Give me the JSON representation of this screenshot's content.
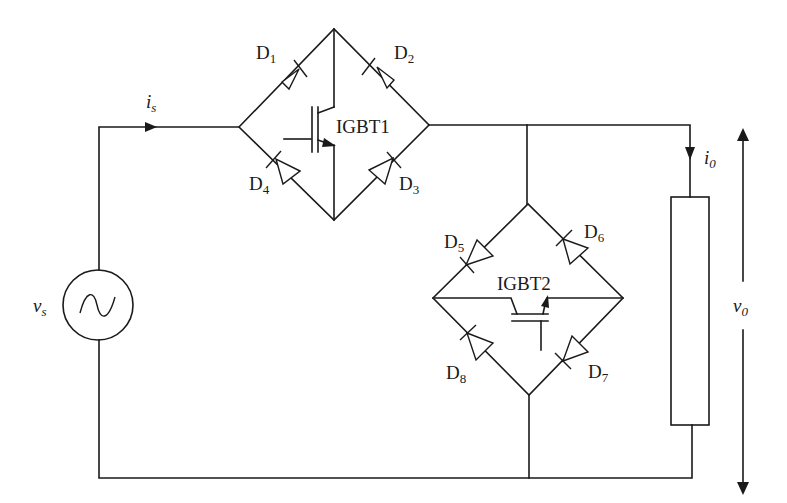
{
  "diagram": {
    "type": "circuit-schematic",
    "colors": {
      "line": "#1a1a1a",
      "background": "#ffffff"
    }
  },
  "source": {
    "label_main": "v",
    "label_sub": "s",
    "icon": "ac-sine-source-icon"
  },
  "source_current": {
    "label_main": "i",
    "label_sub": "s",
    "icon": "arrow-right-icon"
  },
  "bridge1": {
    "switch_label": "IGBT1",
    "diodes": [
      {
        "main": "D",
        "sub": "1"
      },
      {
        "main": "D",
        "sub": "2"
      },
      {
        "main": "D",
        "sub": "3"
      },
      {
        "main": "D",
        "sub": "4"
      }
    ]
  },
  "bridge2": {
    "switch_label": "IGBT2",
    "diodes": [
      {
        "main": "D",
        "sub": "5"
      },
      {
        "main": "D",
        "sub": "6"
      },
      {
        "main": "D",
        "sub": "7"
      },
      {
        "main": "D",
        "sub": "8"
      }
    ]
  },
  "load": {
    "current_main": "i",
    "current_sub": "0",
    "voltage_main": "v",
    "voltage_sub": "0",
    "icon": "resistor-icon"
  }
}
